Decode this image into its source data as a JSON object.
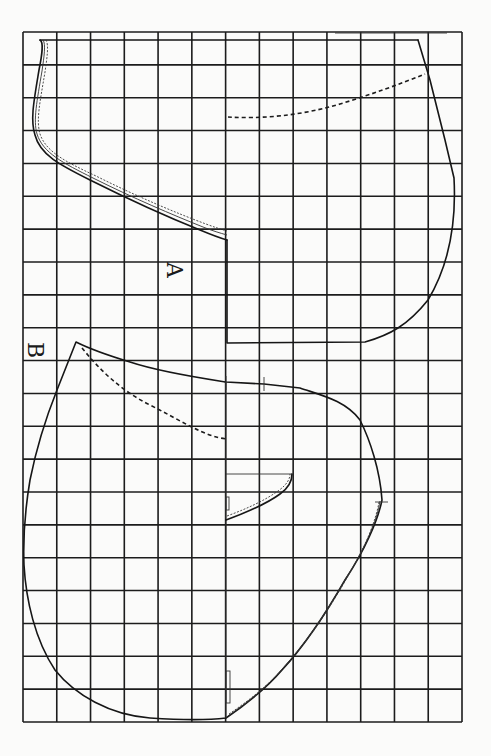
{
  "diagram": {
    "type": "sewing-pattern-grid",
    "grid": {
      "columns": 13,
      "rows": 21,
      "left": 23,
      "top": 32,
      "right": 462,
      "bottom": 722,
      "line_color": "#1c1c1c"
    },
    "pieces": [
      {
        "id": "A",
        "label": "A",
        "label_rotation": 90,
        "label_position": [
          175,
          270
        ]
      },
      {
        "id": "B",
        "label": "B",
        "label_rotation": 90,
        "label_position": [
          36,
          350
        ]
      }
    ],
    "line_styles": {
      "outline": "solid",
      "seam_allowance": "fine dotted double line",
      "fold_guide": "dashed"
    },
    "colors": {
      "paper": "#fbfbfa",
      "ink": "#161616"
    }
  }
}
